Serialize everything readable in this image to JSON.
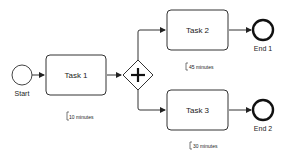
{
  "diagram": {
    "type": "bpmn-process",
    "nodes": {
      "start": {
        "label": "Start"
      },
      "task1": {
        "label": "Task 1",
        "annotation": "10 minutes"
      },
      "gateway": {
        "label": "",
        "kind": "parallel"
      },
      "task2": {
        "label": "Task 2",
        "annotation": "45 minutes"
      },
      "task3": {
        "label": "Task 3",
        "annotation": "30 minutes"
      },
      "end1": {
        "label": "End 1"
      },
      "end2": {
        "label": "End 2"
      }
    },
    "edges": [
      {
        "from": "start",
        "to": "task1"
      },
      {
        "from": "task1",
        "to": "gateway"
      },
      {
        "from": "gateway",
        "to": "task2"
      },
      {
        "from": "gateway",
        "to": "task3"
      },
      {
        "from": "task2",
        "to": "end1"
      },
      {
        "from": "task3",
        "to": "end2"
      }
    ],
    "colors": {
      "stroke": "#222222",
      "fill": "#ffffff",
      "annotation_stroke": "#555555"
    }
  }
}
